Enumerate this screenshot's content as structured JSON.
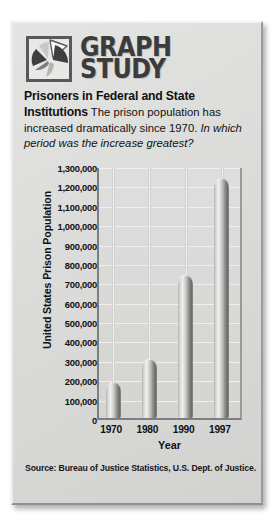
{
  "logo": {
    "icon": "pie-chart-icon",
    "line1": "GRAPH",
    "line2": "STUDY"
  },
  "heading": {
    "title": "Prisoners in Federal and State Institutions",
    "title_part1": "Prisoners in Federal and State",
    "title_part2": "Institutions",
    "body": "The prison population has increased dramatically since 1970.",
    "question": "In which period was the increase greatest?"
  },
  "source": {
    "text": "Source: Bureau of Justice Statistics, U.S. Dept. of Justice."
  },
  "chart_data": {
    "type": "bar",
    "title": "Prisoners in Federal and State Institutions",
    "xlabel": "Year",
    "ylabel": "United States Prison Population",
    "categories": [
      "1970",
      "1980",
      "1990",
      "1997"
    ],
    "values": [
      196000,
      315000,
      750000,
      1250000
    ],
    "ylim": [
      0,
      1300000
    ],
    "ytick_values": [
      0,
      100000,
      200000,
      300000,
      400000,
      500000,
      600000,
      700000,
      800000,
      900000,
      1000000,
      1100000,
      1200000,
      1300000
    ],
    "ytick_labels": [
      "0",
      "100,000",
      "200,000",
      "300,000",
      "400,000",
      "500,000",
      "600,000",
      "700,000",
      "800,000",
      "900,000",
      "1,000,000",
      "1,100,000",
      "1,200,000",
      "1,300,000"
    ],
    "grid": true,
    "legend": "none",
    "bar_style": "3d-cylinder",
    "colors": {
      "bar": "#8c8c8a",
      "plot_background": "#d8d8d6",
      "card_background": "#dcdcda",
      "text": "#111113",
      "axis": "#7e7e80"
    }
  }
}
